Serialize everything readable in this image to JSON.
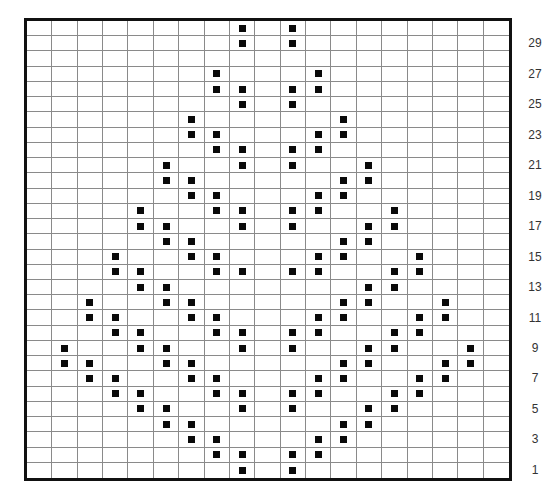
{
  "chart": {
    "columns": 19,
    "rows": 30,
    "mark_color": "#0a0a0a",
    "grid_line_color": "#8a8a8a",
    "border_color": "#111111",
    "row_labels": [
      "1",
      "3",
      "5",
      "7",
      "9",
      "11",
      "13",
      "15",
      "17",
      "19",
      "21",
      "23",
      "25",
      "27",
      "29"
    ]
  },
  "chart_data": {
    "type": "table",
    "title": "",
    "xlabel": "",
    "ylabel": "Row",
    "row_numbering": "bottom-up, odd rows labeled",
    "marks_by_row": {
      "30": [
        9,
        11
      ],
      "29": [
        9,
        11
      ],
      "28": [],
      "27": [
        8,
        12
      ],
      "26": [
        8,
        9,
        11,
        12
      ],
      "25": [
        9,
        11
      ],
      "24": [
        7,
        13
      ],
      "23": [
        7,
        8,
        12,
        13
      ],
      "22": [
        8,
        9,
        11,
        12
      ],
      "21": [
        6,
        9,
        11,
        14
      ],
      "20": [
        6,
        7,
        13,
        14
      ],
      "19": [
        7,
        8,
        12,
        13
      ],
      "18": [
        5,
        8,
        9,
        11,
        12,
        15
      ],
      "17": [
        5,
        6,
        9,
        11,
        14,
        15
      ],
      "16": [
        6,
        7,
        13,
        14
      ],
      "15": [
        4,
        7,
        8,
        12,
        13,
        16
      ],
      "14": [
        4,
        5,
        8,
        9,
        11,
        12,
        15,
        16
      ],
      "13": [
        5,
        6,
        14,
        15
      ],
      "12": [
        3,
        6,
        7,
        13,
        14,
        17
      ],
      "11": [
        3,
        4,
        7,
        8,
        12,
        13,
        16,
        17
      ],
      "10": [
        4,
        5,
        8,
        9,
        11,
        12,
        15,
        16
      ],
      "9": [
        2,
        5,
        6,
        9,
        11,
        14,
        15,
        18
      ],
      "8": [
        2,
        3,
        6,
        7,
        13,
        14,
        17,
        18
      ],
      "7": [
        3,
        4,
        7,
        8,
        12,
        13,
        16,
        17
      ],
      "6": [
        4,
        5,
        8,
        9,
        11,
        12,
        15,
        16
      ],
      "5": [
        5,
        6,
        9,
        11,
        14,
        15
      ],
      "4": [
        6,
        7,
        13,
        14
      ],
      "3": [
        7,
        8,
        12,
        13
      ],
      "2": [
        8,
        9,
        11,
        12
      ],
      "1": [
        9,
        11
      ]
    }
  }
}
